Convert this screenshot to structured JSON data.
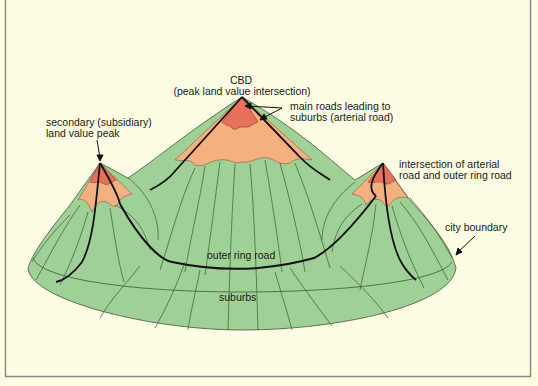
{
  "diagram": {
    "type": "urban land value surface",
    "colors": {
      "background": "#fefce2",
      "frame": "#8a8a86",
      "suburbs_green": "#9fd096",
      "mid_orange": "#f4b07e",
      "peak_red": "#e8715c",
      "road": "#111111",
      "contour": "#3c5a38"
    },
    "labels": {
      "cbd_title": "CBD",
      "cbd_sub": "(peak land value intersection)",
      "main_roads_1": "main roads leading to",
      "main_roads_2": "suburbs (arterial road)",
      "secondary_1": "secondary (subsidiary)",
      "secondary_2": "land value peak",
      "intersection_1": "intersection of arterial",
      "intersection_2": "road and outer ring road",
      "city_boundary": "city boundary",
      "outer_ring_road": "outer ring road",
      "suburbs": "suburbs"
    }
  }
}
